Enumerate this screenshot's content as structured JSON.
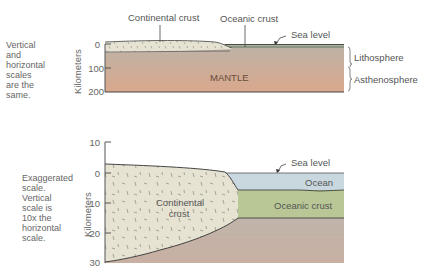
{
  "top_panel": {
    "note": [
      "Vertical",
      "and",
      "horizontal",
      "scales",
      "are the",
      "same."
    ],
    "axis_title": "Kilometers",
    "ticks": [
      "0",
      "100",
      "200"
    ],
    "labels": {
      "continental_crust": "Continental crust",
      "oceanic_crust": "Oceanic crust",
      "sea_level": "Sea level",
      "mantle": "MANTLE",
      "lithosphere": "Lithosphere",
      "asthenosphere": "Asthenosphere"
    }
  },
  "bottom_panel": {
    "note": [
      "Exaggerated",
      "scale.",
      "Vertical",
      "scale is",
      "10x the",
      "horizontal",
      "scale."
    ],
    "axis_title": "Kilometers",
    "ticks": [
      "10",
      "0",
      "10",
      "20",
      "30"
    ],
    "labels": {
      "sea_level": "Sea level",
      "ocean": "Ocean",
      "continental_crust_line1": "Continental",
      "continental_crust_line2": "crust",
      "oceanic_crust": "Oceanic crust"
    }
  },
  "colors": {
    "continental_crust": "#e6e3d3",
    "ocean": "#c9d8df",
    "oceanic_crust": "#b8c795",
    "mantle_top": "#bfb2a6",
    "mantle_bottom": "#d9a88a",
    "outline": "#333333"
  }
}
